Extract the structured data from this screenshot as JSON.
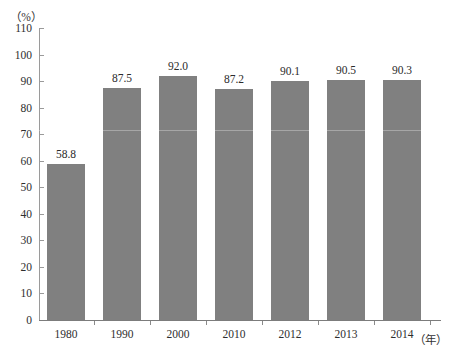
{
  "chart_data": {
    "type": "bar",
    "title": "",
    "subtitle": "",
    "xlabel": "（年）",
    "ylabel": "（%）",
    "categories": [
      "1980",
      "1990",
      "2000",
      "2010",
      "2012",
      "2013",
      "2014"
    ],
    "values": [
      58.8,
      87.5,
      92.0,
      87.2,
      90.1,
      90.5,
      90.3
    ],
    "value_labels": [
      "58.8",
      "87.5",
      "92.0",
      "87.2",
      "90.1",
      "90.5",
      "90.3"
    ],
    "ylim": [
      0,
      110
    ],
    "ytick_step": 10,
    "ytick_labels": [
      "110",
      "100",
      "90",
      "80",
      "70",
      "60",
      "50",
      "40",
      "30",
      "20",
      "10",
      "0"
    ],
    "grid": false,
    "legend": null,
    "legend_position": "none",
    "bar_color": "#808080",
    "axis_color": "#8a8a8a",
    "background_color": "#ffffff",
    "series": [
      {
        "name": "",
        "values": [
          58.8,
          87.5,
          92.0,
          87.2,
          90.1,
          90.5,
          90.3
        ]
      }
    ]
  },
  "axes": {
    "y_unit": "（%）",
    "x_unit": "（年）"
  }
}
